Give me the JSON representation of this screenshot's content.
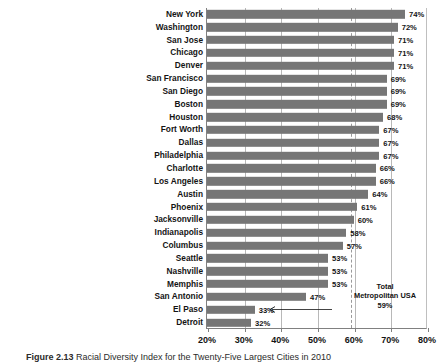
{
  "caption": {
    "number": "Figure 2.13",
    "text": "Racial Diversity Index for the Twenty-Five Largest Cities in 2010"
  },
  "annotation": {
    "line1": "Total",
    "line2": "Metropolitan USA",
    "line3": "59%",
    "value": 59,
    "arrow_icon": "left-arrow-icon"
  },
  "colors": {
    "bar": "#767676",
    "grid": "#b8b8b8",
    "axis": "#808080",
    "reference_line": "#9a9a9a",
    "text": "#141414"
  },
  "chart_data": {
    "type": "bar",
    "orientation": "horizontal",
    "title": "Racial Diversity Index for the Twenty-Five Largest Cities in 2010",
    "xlabel": "",
    "ylabel": "",
    "xlim": [
      20,
      80
    ],
    "xticks": [
      20,
      30,
      40,
      50,
      60,
      70,
      80
    ],
    "xtick_labels": [
      "20%",
      "30%",
      "40%",
      "50%",
      "60%",
      "70%",
      "80%"
    ],
    "grid": true,
    "legend": false,
    "value_suffix": "%",
    "reference_line": {
      "value": 59,
      "style": "dashed",
      "label": "Total Metropolitan USA 59%"
    },
    "categories": [
      "New York",
      "Washington",
      "San Jose",
      "Chicago",
      "Denver",
      "San Francisco",
      "San Diego",
      "Boston",
      "Houston",
      "Fort Worth",
      "Dallas",
      "Philadelphia",
      "Charlotte",
      "Los Angeles",
      "Austin",
      "Phoenix",
      "Jacksonville",
      "Indianapolis",
      "Columbus",
      "Seattle",
      "Nashville",
      "Memphis",
      "San Antonio",
      "El Paso",
      "Detroit"
    ],
    "values": [
      74,
      72,
      71,
      71,
      71,
      69,
      69,
      69,
      68,
      67,
      67,
      67,
      66,
      66,
      64,
      61,
      60,
      58,
      57,
      53,
      53,
      53,
      47,
      33,
      32
    ],
    "value_labels": [
      "74%",
      "72%",
      "71%",
      "71%",
      "71%",
      "69%",
      "69%",
      "69%",
      "68%",
      "67%",
      "67%",
      "67%",
      "66%",
      "66%",
      "64%",
      "61%",
      "60%",
      "58%",
      "57%",
      "53%",
      "53%",
      "53%",
      "47%",
      "33%",
      "32%"
    ]
  }
}
